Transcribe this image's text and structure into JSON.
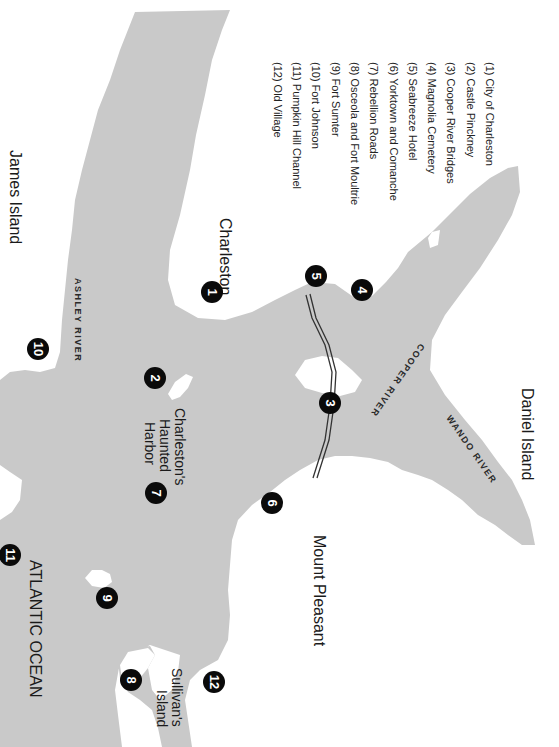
{
  "map": {
    "orientation": "rotated-90-clockwise",
    "colors": {
      "water": "#c9c9c9",
      "land": "#ffffff",
      "marker": "#0a0a0a",
      "text": "#1a1a1a"
    },
    "place_labels": {
      "charleston": "Charleston",
      "james_island": "James Island",
      "daniel_island": "Daniel Island",
      "mount_pleasant": "Mount Pleasant",
      "atlantic_ocean": "ATLANTIC OCEAN",
      "harbor_line1": "Charleston's",
      "harbor_line2": "Haunted",
      "harbor_line3": "Harbor",
      "sullivans_line1": "Sullivan's",
      "sullivans_line2": "Island"
    },
    "river_labels": {
      "ashley": "ASHLEY RIVER",
      "cooper": "COOPER RIVER",
      "wando": "WANDO RIVER"
    },
    "markers": [
      {
        "number": "1",
        "x": 212,
        "y": 292
      },
      {
        "number": "2",
        "x": 155,
        "y": 378
      },
      {
        "number": "3",
        "x": 330,
        "y": 403
      },
      {
        "number": "4",
        "x": 362,
        "y": 290
      },
      {
        "number": "5",
        "x": 316,
        "y": 276
      },
      {
        "number": "6",
        "x": 272,
        "y": 503
      },
      {
        "number": "7",
        "x": 156,
        "y": 493
      },
      {
        "number": "8",
        "x": 131,
        "y": 680
      },
      {
        "number": "9",
        "x": 107,
        "y": 598
      },
      {
        "number": "10",
        "x": 38,
        "y": 349
      },
      {
        "number": "11",
        "x": 10,
        "y": 555
      },
      {
        "number": "12",
        "x": 214,
        "y": 682
      }
    ],
    "legend": [
      "(1) City of Charleston",
      "(2) Castle Pinckney",
      "(3) Cooper River Bridges",
      "(4) Magnolia Cemetery",
      "(5) Seabreeze Hotel",
      "(6) Yorktown and Comanche",
      "(7) Rebellion Roads",
      "(8) Osceola and Fort Moultrie",
      "(9) Fort Sumter",
      "(10) Fort Johnson",
      "(11) Pumpkin Hill Channel",
      "(12) Old Village"
    ]
  }
}
